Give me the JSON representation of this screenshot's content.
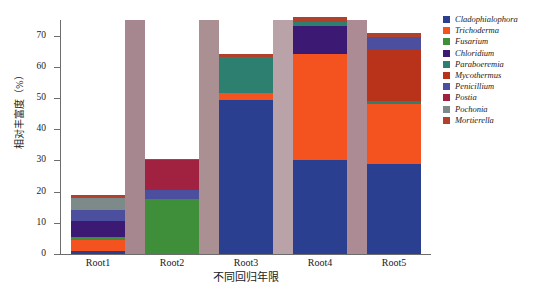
{
  "chart_data": {
    "type": "bar",
    "title": "",
    "subtitle": "",
    "xlabel": "不同回归年限",
    "ylabel": "相对丰富度（%）",
    "categories": [
      "Root1",
      "Root2",
      "Root3",
      "Root4",
      "Root5"
    ],
    "ylim": [
      0,
      75
    ],
    "yticks": [
      0,
      10,
      20,
      30,
      40,
      50,
      60,
      70
    ],
    "ytick_labels": [
      "0",
      "10",
      "20",
      "30",
      "40",
      "50",
      "60",
      "70"
    ],
    "grid": false,
    "stacked": true,
    "legend_position": "right",
    "series": [
      {
        "name": "Cladophialophora",
        "color": "#2b3f91",
        "values": [
          1.0,
          0.0,
          49.5,
          30.0,
          29.0
        ]
      },
      {
        "name": "Trichoderma",
        "color": "#f4531f",
        "values": [
          3.5,
          0.0,
          2.0,
          34.0,
          19.0
        ]
      },
      {
        "name": "Fusarium",
        "color": "#3f8f3a",
        "values": [
          1.0,
          17.5,
          0.0,
          0.0,
          0.0
        ]
      },
      {
        "name": "Chloridium",
        "color": "#3c1a73",
        "values": [
          5.0,
          0.0,
          0.0,
          9.0,
          0.0
        ]
      },
      {
        "name": "Paraboeremia",
        "color": "#2d7f6f",
        "values": [
          0.0,
          0.0,
          11.8,
          1.5,
          1.0
        ]
      },
      {
        "name": "Mycothermus",
        "color": "#b8331a",
        "values": [
          0.0,
          0.0,
          0.0,
          0.0,
          16.5
        ]
      },
      {
        "name": "Penicillium",
        "color": "#4b4f9e",
        "values": [
          3.5,
          3.0,
          0.0,
          0.0,
          4.0
        ]
      },
      {
        "name": "Postia",
        "color": "#a02140",
        "values": [
          0.0,
          9.5,
          0.0,
          0.0,
          0.0
        ]
      },
      {
        "name": "Pochonia",
        "color": "#7d8a8a",
        "values": [
          4.0,
          0.0,
          0.0,
          0.0,
          0.0
        ]
      },
      {
        "name": "Mortierella",
        "color": "#b1412c",
        "values": [
          0.8,
          0.4,
          0.8,
          1.5,
          1.5
        ]
      }
    ],
    "totals": [
      18.8,
      30.4,
      64.1,
      76.0,
      71.0
    ]
  }
}
